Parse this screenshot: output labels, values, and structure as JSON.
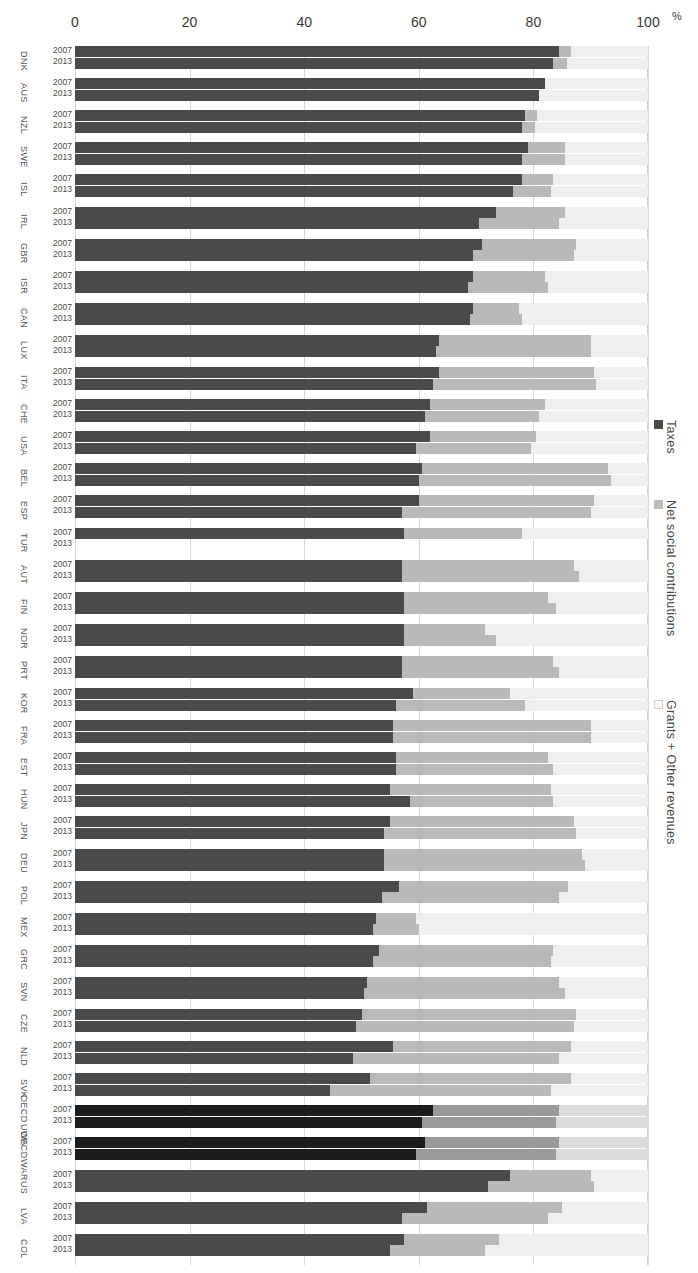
{
  "axis": {
    "unit": "%",
    "ticks": [
      "0",
      "20",
      "40",
      "60",
      "80",
      "100"
    ],
    "tick_values": [
      0,
      20,
      40,
      60,
      80,
      100
    ],
    "min": 0,
    "max": 100
  },
  "row_years": [
    "2007",
    "2013"
  ],
  "legend": {
    "items": [
      {
        "label": "Taxes",
        "color": "#4a4a4a",
        "key": "taxes"
      },
      {
        "label": "Net social contributions",
        "color": "#bdbdbd",
        "key": "nsc"
      },
      {
        "label": "Grants + Other revenues",
        "color": "#fbfbfb",
        "key": "gor"
      }
    ]
  },
  "chart_data": {
    "type": "bar",
    "subtype": "stacked-horizontal-grouped",
    "title": "",
    "xlabel": "%",
    "ylabel": "",
    "xlim": [
      0,
      100
    ],
    "grid": true,
    "legend_position": "right",
    "xticks": [
      0,
      20,
      40,
      60,
      80,
      100
    ],
    "categories": [
      "DNK",
      "AUS",
      "NZL",
      "SWE",
      "ISL",
      "IRL",
      "GBR",
      "ISR",
      "CAN",
      "LUX",
      "ITA",
      "CHE",
      "USA",
      "BEL",
      "ESP",
      "TUR",
      "AUT",
      "FIN",
      "NOR",
      "PRT",
      "KOR",
      "FRA",
      "EST",
      "HUN",
      "JPN",
      "DEU",
      "POL",
      "MEX",
      "GRC",
      "SVN",
      "CZE",
      "NLD",
      "SVK",
      "OECD UWA",
      "OECD WA",
      "RUS",
      "LVA",
      "COL"
    ],
    "series_names": [
      "Taxes",
      "Net social contributions",
      "Grants + Other revenues"
    ],
    "sub_groups": [
      "2007",
      "2013"
    ],
    "rows": [
      {
        "code": "DNK",
        "label": "DNK",
        "average": false,
        "bars": [
          {
            "year": "2007",
            "taxes": 84.5,
            "nsc": 2.0,
            "gor": 13.5
          },
          {
            "year": "2013",
            "taxes": 83.5,
            "nsc": 2.3,
            "gor": 14.2
          }
        ]
      },
      {
        "code": "AUS",
        "label": "AUS",
        "average": false,
        "bars": [
          {
            "year": "2007",
            "taxes": 82.0,
            "nsc": 0.0,
            "gor": 18.0
          },
          {
            "year": "2013",
            "taxes": 81.0,
            "nsc": 0.0,
            "gor": 19.0
          }
        ]
      },
      {
        "code": "NZL",
        "label": "NZL",
        "average": false,
        "bars": [
          {
            "year": "2007",
            "taxes": 78.5,
            "nsc": 2.2,
            "gor": 19.3
          },
          {
            "year": "2013",
            "taxes": 78.0,
            "nsc": 2.3,
            "gor": 19.7
          }
        ]
      },
      {
        "code": "SWE",
        "label": "SWE",
        "average": false,
        "bars": [
          {
            "year": "2007",
            "taxes": 79.0,
            "nsc": 6.5,
            "gor": 14.5
          },
          {
            "year": "2013",
            "taxes": 78.0,
            "nsc": 7.5,
            "gor": 14.5
          }
        ]
      },
      {
        "code": "ISL",
        "label": "ISL",
        "average": false,
        "bars": [
          {
            "year": "2007",
            "taxes": 78.0,
            "nsc": 5.5,
            "gor": 16.5
          },
          {
            "year": "2013",
            "taxes": 76.5,
            "nsc": 6.5,
            "gor": 17.0
          }
        ]
      },
      {
        "code": "IRL",
        "label": "IRL",
        "average": false,
        "bars": [
          {
            "year": "2007",
            "taxes": 73.5,
            "nsc": 12.0,
            "gor": 14.5
          },
          {
            "year": "2013",
            "taxes": 70.5,
            "nsc": 14.0,
            "gor": 15.5
          }
        ]
      },
      {
        "code": "GBR",
        "label": "GBR",
        "average": false,
        "bars": [
          {
            "year": "2007",
            "taxes": 71.0,
            "nsc": 16.5,
            "gor": 12.5
          },
          {
            "year": "2013",
            "taxes": 69.5,
            "nsc": 17.5,
            "gor": 13.0
          }
        ]
      },
      {
        "code": "ISR",
        "label": "ISR",
        "average": false,
        "bars": [
          {
            "year": "2007",
            "taxes": 69.5,
            "nsc": 12.5,
            "gor": 18.0
          },
          {
            "year": "2013",
            "taxes": 68.5,
            "nsc": 14.0,
            "gor": 17.5
          }
        ]
      },
      {
        "code": "CAN",
        "label": "CAN",
        "average": false,
        "bars": [
          {
            "year": "2007",
            "taxes": 69.5,
            "nsc": 8.0,
            "gor": 22.5
          },
          {
            "year": "2013",
            "taxes": 69.0,
            "nsc": 9.0,
            "gor": 22.0
          }
        ]
      },
      {
        "code": "LUX",
        "label": "LUX",
        "average": false,
        "bars": [
          {
            "year": "2007",
            "taxes": 63.5,
            "nsc": 26.5,
            "gor": 10.0
          },
          {
            "year": "2013",
            "taxes": 63.0,
            "nsc": 27.0,
            "gor": 10.0
          }
        ]
      },
      {
        "code": "ITA",
        "label": "ITA",
        "average": false,
        "bars": [
          {
            "year": "2007",
            "taxes": 63.5,
            "nsc": 27.0,
            "gor": 9.5
          },
          {
            "year": "2013",
            "taxes": 62.5,
            "nsc": 28.5,
            "gor": 9.0
          }
        ]
      },
      {
        "code": "CHE",
        "label": "CHE",
        "average": false,
        "bars": [
          {
            "year": "2007",
            "taxes": 62.0,
            "nsc": 20.0,
            "gor": 18.0
          },
          {
            "year": "2013",
            "taxes": 61.0,
            "nsc": 20.0,
            "gor": 19.0
          }
        ]
      },
      {
        "code": "USA",
        "label": "USA",
        "average": false,
        "bars": [
          {
            "year": "2007",
            "taxes": 62.0,
            "nsc": 18.5,
            "gor": 19.5
          },
          {
            "year": "2013",
            "taxes": 59.5,
            "nsc": 20.0,
            "gor": 20.5
          }
        ]
      },
      {
        "code": "BEL",
        "label": "BEL",
        "average": false,
        "bars": [
          {
            "year": "2007",
            "taxes": 60.5,
            "nsc": 32.5,
            "gor": 7.0
          },
          {
            "year": "2013",
            "taxes": 60.0,
            "nsc": 33.5,
            "gor": 6.5
          }
        ]
      },
      {
        "code": "ESP",
        "label": "ESP",
        "average": false,
        "bars": [
          {
            "year": "2007",
            "taxes": 60.0,
            "nsc": 30.5,
            "gor": 9.5
          },
          {
            "year": "2013",
            "taxes": 57.0,
            "nsc": 33.0,
            "gor": 10.0
          }
        ]
      },
      {
        "code": "TUR",
        "label": "TUR",
        "average": false,
        "bars": [
          {
            "year": "2007",
            "taxes": 57.5,
            "nsc": 20.5,
            "gor": 22.0
          },
          {
            "year": "2013",
            "taxes": null,
            "nsc": null,
            "gor": null
          }
        ]
      },
      {
        "code": "AUT",
        "label": "AUT",
        "average": false,
        "bars": [
          {
            "year": "2007",
            "taxes": 57.0,
            "nsc": 30.0,
            "gor": 13.0
          },
          {
            "year": "2013",
            "taxes": 57.0,
            "nsc": 31.0,
            "gor": 12.0
          }
        ]
      },
      {
        "code": "FIN",
        "label": "FIN",
        "average": false,
        "bars": [
          {
            "year": "2007",
            "taxes": 57.5,
            "nsc": 25.0,
            "gor": 17.5
          },
          {
            "year": "2013",
            "taxes": 57.5,
            "nsc": 26.5,
            "gor": 16.0
          }
        ]
      },
      {
        "code": "NOR",
        "label": "NOR",
        "average": false,
        "bars": [
          {
            "year": "2007",
            "taxes": 57.5,
            "nsc": 14.0,
            "gor": 28.5
          },
          {
            "year": "2013",
            "taxes": 57.5,
            "nsc": 16.0,
            "gor": 26.5
          }
        ]
      },
      {
        "code": "PRT",
        "label": "PRT",
        "average": false,
        "bars": [
          {
            "year": "2007",
            "taxes": 57.0,
            "nsc": 26.5,
            "gor": 16.5
          },
          {
            "year": "2013",
            "taxes": 57.0,
            "nsc": 27.5,
            "gor": 15.5
          }
        ]
      },
      {
        "code": "KOR",
        "label": "KOR",
        "average": false,
        "bars": [
          {
            "year": "2007",
            "taxes": 59.0,
            "nsc": 17.0,
            "gor": 24.0
          },
          {
            "year": "2013",
            "taxes": 56.0,
            "nsc": 22.5,
            "gor": 21.5
          }
        ]
      },
      {
        "code": "FRA",
        "label": "FRA",
        "average": false,
        "bars": [
          {
            "year": "2007",
            "taxes": 55.5,
            "nsc": 34.5,
            "gor": 10.0
          },
          {
            "year": "2013",
            "taxes": 55.5,
            "nsc": 34.5,
            "gor": 10.0
          }
        ]
      },
      {
        "code": "EST",
        "label": "EST",
        "average": false,
        "bars": [
          {
            "year": "2007",
            "taxes": 56.0,
            "nsc": 26.5,
            "gor": 17.5
          },
          {
            "year": "2013",
            "taxes": 56.0,
            "nsc": 27.5,
            "gor": 16.5
          }
        ]
      },
      {
        "code": "HUN",
        "label": "HUN",
        "average": false,
        "bars": [
          {
            "year": "2007",
            "taxes": 55.0,
            "nsc": 28.0,
            "gor": 17.0
          },
          {
            "year": "2013",
            "taxes": 58.5,
            "nsc": 25.0,
            "gor": 16.5
          }
        ]
      },
      {
        "code": "JPN",
        "label": "JPN",
        "average": false,
        "bars": [
          {
            "year": "2007",
            "taxes": 55.0,
            "nsc": 32.0,
            "gor": 13.0
          },
          {
            "year": "2013",
            "taxes": 54.0,
            "nsc": 33.5,
            "gor": 12.5
          }
        ]
      },
      {
        "code": "DEU",
        "label": "DEU",
        "average": false,
        "bars": [
          {
            "year": "2007",
            "taxes": 54.0,
            "nsc": 34.5,
            "gor": 11.5
          },
          {
            "year": "2013",
            "taxes": 54.0,
            "nsc": 35.0,
            "gor": 11.0
          }
        ]
      },
      {
        "code": "POL",
        "label": "POL",
        "average": false,
        "bars": [
          {
            "year": "2007",
            "taxes": 56.5,
            "nsc": 29.5,
            "gor": 14.0
          },
          {
            "year": "2013",
            "taxes": 53.5,
            "nsc": 31.0,
            "gor": 15.5
          }
        ]
      },
      {
        "code": "MEX",
        "label": "MEX",
        "average": false,
        "bars": [
          {
            "year": "2007",
            "taxes": 52.5,
            "nsc": 7.0,
            "gor": 40.5
          },
          {
            "year": "2013",
            "taxes": 52.0,
            "nsc": 8.0,
            "gor": 40.0
          }
        ]
      },
      {
        "code": "GRC",
        "label": "GRC",
        "average": false,
        "bars": [
          {
            "year": "2007",
            "taxes": 53.0,
            "nsc": 30.5,
            "gor": 16.5
          },
          {
            "year": "2013",
            "taxes": 52.0,
            "nsc": 31.0,
            "gor": 17.0
          }
        ]
      },
      {
        "code": "SVN",
        "label": "SVN",
        "average": false,
        "bars": [
          {
            "year": "2007",
            "taxes": 51.0,
            "nsc": 33.5,
            "gor": 15.5
          },
          {
            "year": "2013",
            "taxes": 50.5,
            "nsc": 35.0,
            "gor": 14.5
          }
        ]
      },
      {
        "code": "CZE",
        "label": "CZE",
        "average": false,
        "bars": [
          {
            "year": "2007",
            "taxes": 50.0,
            "nsc": 37.5,
            "gor": 12.5
          },
          {
            "year": "2013",
            "taxes": 49.0,
            "nsc": 38.0,
            "gor": 13.0
          }
        ]
      },
      {
        "code": "NLD",
        "label": "NLD",
        "average": false,
        "bars": [
          {
            "year": "2007",
            "taxes": 55.5,
            "nsc": 31.0,
            "gor": 13.5
          },
          {
            "year": "2013",
            "taxes": 48.5,
            "nsc": 36.0,
            "gor": 15.5
          }
        ]
      },
      {
        "code": "SVK",
        "label": "SVK",
        "average": false,
        "bars": [
          {
            "year": "2007",
            "taxes": 51.5,
            "nsc": 35.0,
            "gor": 13.5
          },
          {
            "year": "2013",
            "taxes": 44.5,
            "nsc": 38.5,
            "gor": 17.0
          }
        ]
      },
      {
        "code": "OECD UWA",
        "label": "OECD\nUWA",
        "average": true,
        "bars": [
          {
            "year": "2007",
            "taxes": 62.5,
            "nsc": 22.0,
            "gor": 15.5
          },
          {
            "year": "2013",
            "taxes": 60.5,
            "nsc": 23.5,
            "gor": 16.0
          }
        ]
      },
      {
        "code": "OECD WA",
        "label": "OECD\nWA",
        "average": true,
        "bars": [
          {
            "year": "2007",
            "taxes": 61.0,
            "nsc": 23.5,
            "gor": 15.5
          },
          {
            "year": "2013",
            "taxes": 59.5,
            "nsc": 24.5,
            "gor": 16.0
          }
        ]
      },
      {
        "code": "RUS",
        "label": "RUS",
        "average": false,
        "bars": [
          {
            "year": "2007",
            "taxes": 76.0,
            "nsc": 14.0,
            "gor": 10.0
          },
          {
            "year": "2013",
            "taxes": 72.0,
            "nsc": 18.5,
            "gor": 9.5
          }
        ]
      },
      {
        "code": "LVA",
        "label": "LVA",
        "average": false,
        "bars": [
          {
            "year": "2007",
            "taxes": 61.5,
            "nsc": 23.5,
            "gor": 15.0
          },
          {
            "year": "2013",
            "taxes": 57.0,
            "nsc": 25.5,
            "gor": 17.5
          }
        ]
      },
      {
        "code": "COL",
        "label": "COL",
        "average": false,
        "bars": [
          {
            "year": "2007",
            "taxes": 57.5,
            "nsc": 16.5,
            "gor": 26.0
          },
          {
            "year": "2013",
            "taxes": 55.0,
            "nsc": 16.5,
            "gor": 28.5
          }
        ]
      }
    ]
  }
}
